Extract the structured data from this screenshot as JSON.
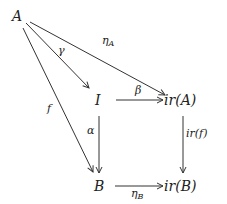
{
  "diagram": {
    "type": "commutative-diagram",
    "nodes": [
      {
        "id": "A",
        "label": "A",
        "x": 18,
        "y": 20
      },
      {
        "id": "I",
        "label": "I",
        "x": 100,
        "y": 105
      },
      {
        "id": "irA",
        "label": "ir(A)",
        "x": 166,
        "y": 105
      },
      {
        "id": "B",
        "label": "B",
        "x": 100,
        "y": 191
      },
      {
        "id": "irB",
        "label": "ir(B)",
        "x": 166,
        "y": 191
      }
    ],
    "edges": [
      {
        "from": "A",
        "to": "I",
        "label": "γ"
      },
      {
        "from": "A",
        "to": "irA",
        "label": "η",
        "label_sub": "A"
      },
      {
        "from": "A",
        "to": "B",
        "label": "f"
      },
      {
        "from": "I",
        "to": "irA",
        "label": "β"
      },
      {
        "from": "I",
        "to": "B",
        "label": "α"
      },
      {
        "from": "irA",
        "to": "irB",
        "label": "ir(f)"
      },
      {
        "from": "B",
        "to": "irB",
        "label": "η",
        "label_sub": "B"
      }
    ],
    "colors": {
      "line": "#333333",
      "text": "#222222",
      "background": "#ffffff"
    }
  }
}
